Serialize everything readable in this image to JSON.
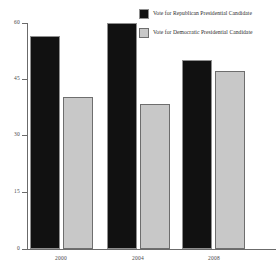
{
  "chart_data": {
    "type": "bar",
    "title": "",
    "subtitle": "",
    "xlabel": "",
    "ylabel": "",
    "categories": [
      "2000",
      "2004",
      "2008"
    ],
    "series": [
      {
        "name": "Vote for Republican Presidential Candidate",
        "color": "#111111",
        "values": [
          56.5,
          60.0,
          50.1
        ]
      },
      {
        "name": "Vote for Democratic Presidential Candidate",
        "color": "#c8c8c8",
        "values": [
          40.3,
          38.5,
          47.2
        ]
      }
    ],
    "ylim": [
      0,
      60
    ],
    "yticks": [
      0,
      15,
      30,
      45,
      60
    ],
    "ytick_labels": [
      "0",
      "15",
      "30",
      "45",
      "60"
    ],
    "grid": false,
    "legend_position": "top-right"
  },
  "axes": {
    "y": {
      "labels": [
        "60",
        "45",
        "30",
        "15",
        "0"
      ]
    },
    "x": {
      "labels": [
        "2000",
        "2004",
        "2008"
      ]
    }
  },
  "legend": {
    "items": [
      {
        "label": "Vote for Republican Presidential Candidate"
      },
      {
        "label": "Vote for Democratic Presidential Candidate"
      }
    ]
  }
}
